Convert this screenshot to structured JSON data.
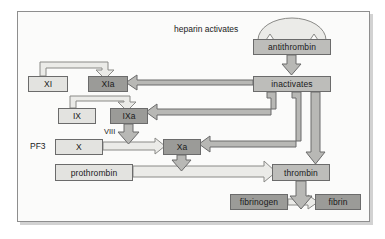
{
  "diagram": {
    "title_label": "heparin activates",
    "nodes": [
      {
        "id": "antithrombin",
        "label": "antithrombin",
        "tone": "mid",
        "x": 253,
        "y": 39,
        "w": 78,
        "h": 16
      },
      {
        "id": "inactivates",
        "label": "inactivates",
        "tone": "mid",
        "x": 253,
        "y": 76,
        "w": 78,
        "h": 16
      },
      {
        "id": "xi",
        "label": "XI",
        "tone": "light",
        "x": 28,
        "y": 76,
        "w": 40,
        "h": 16
      },
      {
        "id": "xia",
        "label": "XIa",
        "tone": "dark",
        "x": 88,
        "y": 76,
        "w": 40,
        "h": 16
      },
      {
        "id": "ix",
        "label": "IX",
        "tone": "light",
        "x": 58,
        "y": 108,
        "w": 38,
        "h": 16
      },
      {
        "id": "ixa",
        "label": "IXa",
        "tone": "dark",
        "x": 110,
        "y": 108,
        "w": 38,
        "h": 16
      },
      {
        "id": "x",
        "label": "X",
        "tone": "light",
        "x": 55,
        "y": 139,
        "w": 48,
        "h": 16
      },
      {
        "id": "xa",
        "label": "Xa",
        "tone": "dark",
        "x": 163,
        "y": 139,
        "w": 38,
        "h": 16
      },
      {
        "id": "prothrombin",
        "label": "prothrombin",
        "tone": "light",
        "x": 55,
        "y": 164,
        "w": 78,
        "h": 17
      },
      {
        "id": "thrombin",
        "label": "thrombin",
        "tone": "mid",
        "x": 272,
        "y": 164,
        "w": 58,
        "h": 17
      },
      {
        "id": "fibrinogen",
        "label": "fibrinogen",
        "tone": "dark",
        "x": 230,
        "y": 194,
        "w": 58,
        "h": 16
      },
      {
        "id": "fibrin",
        "label": "fibrin",
        "tone": "dark",
        "x": 315,
        "y": 194,
        "w": 46,
        "h": 16
      }
    ],
    "side_labels": [
      {
        "id": "pf3",
        "label": "PF3",
        "x": 30,
        "y": 141
      },
      {
        "id": "viii",
        "label": "VIII",
        "x": 104,
        "y": 127
      }
    ],
    "edges": [
      {
        "id": "heparin-to-antithrombin",
        "from": "heparin-arc",
        "to": "antithrombin",
        "style": "outline-arc"
      },
      {
        "id": "antithrombin-to-inactivates",
        "from": "antithrombin",
        "to": "inactivates",
        "style": "solid-down"
      },
      {
        "id": "xi-to-xia",
        "from": "xi",
        "to": "xia",
        "style": "outline-loop"
      },
      {
        "id": "ix-to-ixa",
        "from": "ix",
        "to": "ixa",
        "style": "outline-loop"
      },
      {
        "id": "ixa-to-xa",
        "from": "ixa",
        "to": "xa",
        "style": "solid-down"
      },
      {
        "id": "x-to-xa",
        "from": "x",
        "to": "xa",
        "style": "outline-right"
      },
      {
        "id": "xa-to-prothrombin",
        "from": "xa",
        "to": "prothrombin-line",
        "style": "solid-down"
      },
      {
        "id": "prothrombin-to-thrombin",
        "from": "prothrombin",
        "to": "thrombin",
        "style": "outline-right"
      },
      {
        "id": "thrombin-to-fibrin",
        "from": "thrombin",
        "to": "fibrin",
        "style": "solid-down"
      },
      {
        "id": "fibrinogen-to-fibrin",
        "from": "fibrinogen",
        "to": "fibrin",
        "style": "outline-right"
      },
      {
        "id": "inactivates-to-xia",
        "from": "inactivates",
        "to": "xia",
        "style": "solid-left"
      },
      {
        "id": "inactivates-to-ixa",
        "from": "inactivates",
        "to": "ixa",
        "style": "solid-left"
      },
      {
        "id": "inactivates-to-xa",
        "from": "inactivates",
        "to": "xa",
        "style": "solid-left"
      },
      {
        "id": "inactivates-to-thrombin",
        "from": "inactivates",
        "to": "thrombin",
        "style": "solid-down"
      }
    ],
    "colors": {
      "tone_light": "#e3e3e0",
      "tone_mid": "#bdbdba",
      "tone_dark": "#9b9b98",
      "wire_fill": "#b8b8b5",
      "wire_stroke": "#6b6b6b",
      "outline_fill": "#ebebe8",
      "frame_border": "#8e8e8e",
      "canvas": "#fbfbfa",
      "page": "#ffffff"
    }
  }
}
